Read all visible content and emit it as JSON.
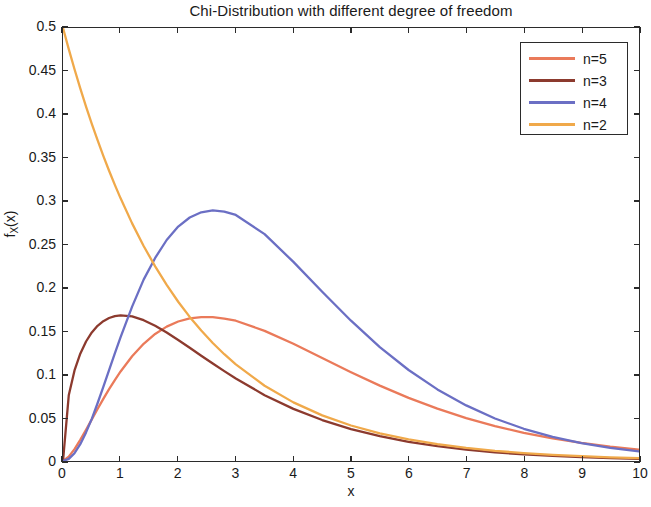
{
  "chart_data": {
    "type": "line",
    "title": "Chi-Distribution with different degree of freedom",
    "xlabel": "x",
    "ylabel": "f_X(x)",
    "ylabel_base": "f",
    "ylabel_sub": "X",
    "ylabel_arg": "(x)",
    "xlim": [
      0,
      10
    ],
    "ylim": [
      0,
      0.5
    ],
    "grid": false,
    "legend_position": "top-right",
    "xticks": [
      0,
      1,
      2,
      3,
      4,
      5,
      6,
      7,
      8,
      9,
      10
    ],
    "xtick_labels": [
      "0",
      "1",
      "2",
      "3",
      "4",
      "5",
      "6",
      "7",
      "8",
      "9",
      "10"
    ],
    "yticks": [
      0,
      0.05,
      0.1,
      0.15,
      0.2,
      0.25,
      0.3,
      0.35,
      0.4,
      0.45,
      0.5
    ],
    "ytick_labels": [
      "0",
      "0.05",
      "0.1",
      "0.15",
      "0.2",
      "0.25",
      "0.3",
      "0.35",
      "0.4",
      "0.45",
      "0.5"
    ],
    "x": [
      0,
      0.1,
      0.2,
      0.3,
      0.4,
      0.5,
      0.6,
      0.7,
      0.8,
      0.9,
      1,
      1.2,
      1.4,
      1.6,
      1.8,
      2,
      2.2,
      2.4,
      2.6,
      2.8,
      3,
      3.5,
      4,
      4.5,
      5,
      5.5,
      6,
      6.5,
      7,
      7.5,
      8,
      8.5,
      9,
      9.5,
      10
    ],
    "series": [
      {
        "name": "n=5",
        "label": "n=5",
        "color": "#ea7a5a",
        "dof": 5,
        "peak_x": 3,
        "peak_y": 0.154,
        "values": [
          0,
          0.005,
          0.0137,
          0.0244,
          0.036,
          0.0481,
          0.0601,
          0.0718,
          0.083,
          0.0935,
          0.1034,
          0.1209,
          0.1353,
          0.1467,
          0.1552,
          0.1611,
          0.1646,
          0.1662,
          0.1661,
          0.1645,
          0.162,
          0.1503,
          0.1353,
          0.1189,
          0.1025,
          0.087,
          0.0729,
          0.0604,
          0.0495,
          0.0403,
          0.0326,
          0.0262,
          0.0209,
          0.0166,
          0.0132
        ]
      },
      {
        "name": "n=3",
        "label": "n=3",
        "color": "#8c3a2e",
        "dof": 3,
        "peak_x": 1,
        "peak_y": 0.242,
        "values": [
          0,
          0.0758,
          0.1046,
          0.1239,
          0.138,
          0.1485,
          0.1561,
          0.1615,
          0.1651,
          0.1673,
          0.1682,
          0.167,
          0.1626,
          0.1561,
          0.1483,
          0.1397,
          0.1307,
          0.1216,
          0.1126,
          0.1038,
          0.0953,
          0.076,
          0.0602,
          0.0473,
          0.0369,
          0.0287,
          0.0222,
          0.0171,
          0.0131,
          0.01,
          0.0077,
          0.0058,
          0.0044,
          0.0034,
          0.0026
        ]
      },
      {
        "name": "n=4",
        "label": "n=4",
        "color": "#6b6fc4",
        "dof": 4,
        "peak_x": 2,
        "peak_y": 0.183,
        "values": [
          0,
          0.0024,
          0.009,
          0.0194,
          0.033,
          0.0487,
          0.0667,
          0.0856,
          0.105,
          0.1242,
          0.143,
          0.1783,
          0.2094,
          0.2345,
          0.2552,
          0.2707,
          0.2812,
          0.2872,
          0.2893,
          0.288,
          0.2841,
          0.262,
          0.2299,
          0.1954,
          0.162,
          0.1316,
          0.1051,
          0.0827,
          0.0642,
          0.0491,
          0.0372,
          0.0278,
          0.0206,
          0.0151,
          0.011
        ]
      },
      {
        "name": "n=2",
        "label": "n=2",
        "color": "#f0a94a",
        "dof": 2,
        "peak_x": 0,
        "peak_y": 0.5,
        "values": [
          0.5,
          0.4756,
          0.4524,
          0.4303,
          0.4093,
          0.3894,
          0.3704,
          0.3524,
          0.3352,
          0.3189,
          0.3033,
          0.2744,
          0.2483,
          0.2247,
          0.2033,
          0.1839,
          0.1664,
          0.1506,
          0.1363,
          0.1233,
          0.1116,
          0.0869,
          0.0677,
          0.0527,
          0.041,
          0.0319,
          0.0249,
          0.0194,
          0.0151,
          0.0117,
          0.0092,
          0.0071,
          0.0056,
          0.0043,
          0.0034
        ]
      }
    ],
    "legend_entries": [
      "n=5",
      "n=3",
      "n=4",
      "n=2"
    ]
  }
}
